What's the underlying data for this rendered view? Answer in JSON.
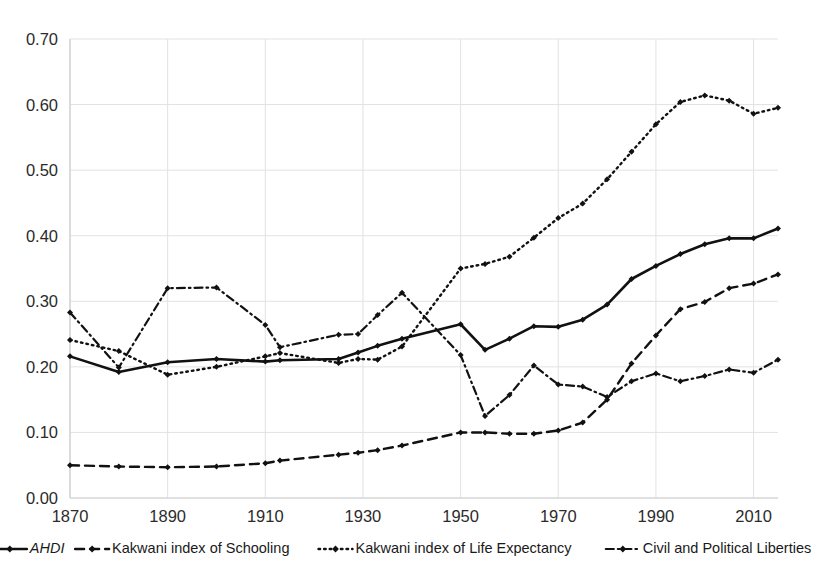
{
  "chart_data": {
    "type": "line",
    "title": "",
    "subtitle": "",
    "xlabel": "",
    "ylabel": "",
    "xlim": [
      1870,
      2015
    ],
    "ylim": [
      0.0,
      0.7
    ],
    "grid": true,
    "legend_position": "bottom",
    "y_ticks": [
      "0.00",
      "0.10",
      "0.20",
      "0.30",
      "0.40",
      "0.50",
      "0.60",
      "0.70"
    ],
    "y_tick_values": [
      0.0,
      0.1,
      0.2,
      0.3,
      0.4,
      0.5,
      0.6,
      0.7
    ],
    "x_ticks": [
      "1870",
      "1890",
      "1910",
      "1930",
      "1950",
      "1970",
      "1990",
      "2010"
    ],
    "x_tick_values": [
      1870,
      1890,
      1910,
      1930,
      1950,
      1970,
      1990,
      2010
    ],
    "x": [
      1870,
      1880,
      1890,
      1900,
      1910,
      1913,
      1925,
      1929,
      1933,
      1938,
      1950,
      1955,
      1960,
      1965,
      1970,
      1975,
      1980,
      1985,
      1990,
      1995,
      2000,
      2005,
      2010,
      2015
    ],
    "series": [
      {
        "name": "AHDI",
        "style": "solid",
        "marker": "diamond",
        "color": "#111111",
        "values": [
          0.216,
          0.192,
          0.207,
          0.212,
          0.208,
          0.21,
          0.212,
          0.222,
          0.232,
          0.243,
          0.265,
          0.226,
          0.243,
          0.262,
          0.261,
          0.272,
          0.295,
          0.334,
          0.354,
          0.372,
          0.387,
          0.396,
          0.396,
          0.411
        ]
      },
      {
        "name": "Kakwani index of Schooling",
        "style": "dashed",
        "marker": "diamond",
        "color": "#111111",
        "values": [
          0.05,
          0.048,
          0.047,
          0.048,
          0.053,
          0.057,
          0.066,
          0.069,
          0.073,
          0.08,
          0.1,
          0.1,
          0.098,
          0.098,
          0.103,
          0.115,
          0.15,
          0.205,
          0.248,
          0.288,
          0.299,
          0.32,
          0.327,
          0.341
        ]
      },
      {
        "name": "Kakwani index of Life Expectancy",
        "style": "dotted",
        "marker": "diamond",
        "color": "#111111",
        "values": [
          0.241,
          0.224,
          0.188,
          0.2,
          0.216,
          0.221,
          0.206,
          0.212,
          0.211,
          0.231,
          0.35,
          0.357,
          0.368,
          0.397,
          0.427,
          0.449,
          0.486,
          0.528,
          0.57,
          0.604,
          0.614,
          0.606,
          0.586,
          0.595
        ]
      },
      {
        "name": "Civil and Political Liberties",
        "style": "dash-dot",
        "marker": "diamond",
        "color": "#111111",
        "values": [
          0.283,
          0.199,
          0.32,
          0.321,
          0.264,
          0.23,
          0.249,
          0.25,
          0.279,
          0.313,
          0.218,
          0.125,
          0.157,
          0.202,
          0.173,
          0.17,
          0.154,
          0.178,
          0.19,
          0.178,
          0.186,
          0.196,
          0.191,
          0.211
        ]
      }
    ]
  },
  "legend": {
    "items": [
      {
        "label": "AHDI",
        "style": "solid",
        "italic": true
      },
      {
        "label": "Kakwani index of Schooling",
        "style": "dashed",
        "italic": false
      },
      {
        "label": "Kakwani index of Life Expectancy",
        "style": "dotted",
        "italic": false
      },
      {
        "label": "Civil and Political Liberties",
        "style": "dash-dot",
        "italic": false
      }
    ]
  }
}
